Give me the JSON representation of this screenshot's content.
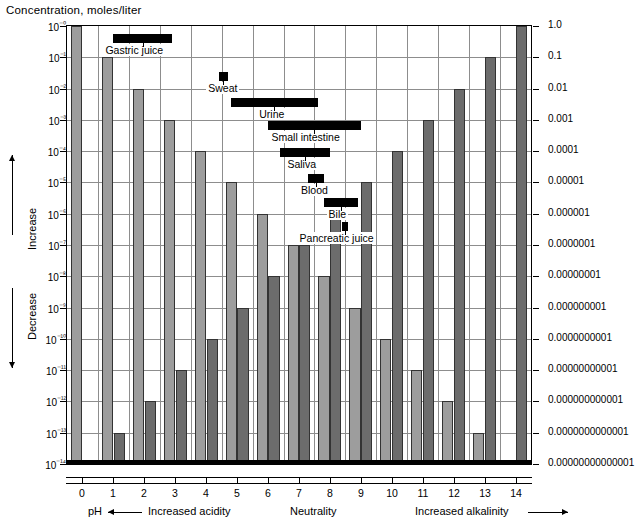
{
  "title": "Concentration, moles/liter",
  "legend": [
    {
      "name": "h-plus",
      "symbol": "=[H⁺]",
      "color": "#9d9d9d"
    },
    {
      "name": "oh-minus",
      "symbol": "=[OH⁻]",
      "color": "#6c6c6c"
    }
  ],
  "axes": {
    "left_ticks": [
      "10⁻⁰",
      "10⁻¹",
      "10⁻²",
      "10⁻³",
      "10⁻⁴",
      "10⁻⁵",
      "10⁻⁶",
      "10⁻⁷",
      "10⁻⁸",
      "10⁻⁹",
      "10⁻¹⁰",
      "10⁻¹¹",
      "10⁻¹²",
      "10⁻¹³",
      "10⁻¹⁴"
    ],
    "right_ticks": [
      "1.0",
      "0.1",
      "0.01",
      "0.001",
      "0.0001",
      "0.00001",
      "0.000001",
      "0.0000001",
      "0.00000001",
      "0.000000001",
      "0.0000000001",
      "0.00000000001",
      "0.000000000001",
      "0.0000000000001",
      "0.00000000000001"
    ],
    "x_ticks": [
      "0",
      "1",
      "2",
      "3",
      "4",
      "5",
      "6",
      "7",
      "8",
      "9",
      "10",
      "11",
      "12",
      "13",
      "14"
    ],
    "x_caption_ph": "pH",
    "x_caption_acidity": "Increased acidity",
    "x_caption_neutrality": "Neutrality",
    "x_caption_alkalinity": "Increased alkalinity",
    "y_caption_increase": "Increase",
    "y_caption_decrease": "Decrease"
  },
  "chart_data": {
    "type": "bar",
    "title": "Concentration, moles/liter",
    "xlabel": "pH",
    "ylabel": "Concentration, moles/liter",
    "ylim": [
      1e-14,
      1
    ],
    "yscale": "log",
    "grid": true,
    "legend_position": "top-right",
    "categories": [
      "0",
      "1",
      "2",
      "3",
      "4",
      "5",
      "6",
      "7",
      "8",
      "9",
      "10",
      "11",
      "12",
      "13",
      "14"
    ],
    "series": [
      {
        "name": "[H+]",
        "color": "#9d9d9d",
        "exponents": [
          0,
          -1,
          -2,
          -3,
          -4,
          -5,
          -6,
          -7,
          -8,
          -9,
          -10,
          -11,
          -12,
          -13,
          -14
        ],
        "values": [
          1,
          0.1,
          0.01,
          0.001,
          0.0001,
          1e-05,
          1e-06,
          1e-07,
          1e-08,
          1e-09,
          1e-10,
          1e-11,
          1e-12,
          1e-13,
          1e-14
        ]
      },
      {
        "name": "[OH-]",
        "color": "#6c6c6c",
        "exponents": [
          -14,
          -13,
          -12,
          -11,
          -10,
          -9,
          -8,
          -7,
          -6,
          -5,
          -4,
          -3,
          -2,
          -1,
          0
        ],
        "values": [
          1e-14,
          1e-13,
          1e-12,
          1e-11,
          1e-10,
          1e-09,
          1e-08,
          1e-07,
          1e-06,
          1e-05,
          0.0001,
          0.001,
          0.01,
          0.1,
          1
        ]
      }
    ],
    "annotations": [
      {
        "label": "Gastric juice",
        "ph_min": 1.0,
        "ph_max": 2.9,
        "row": 0
      },
      {
        "label": "Sweat",
        "ph_min": 4.4,
        "ph_max": 4.7,
        "row": 1
      },
      {
        "label": "Urine",
        "ph_min": 4.8,
        "ph_max": 7.6,
        "row": 2
      },
      {
        "label": "Small intestine",
        "ph_min": 6.0,
        "ph_max": 9.0,
        "row": 3
      },
      {
        "label": "Saliva",
        "ph_min": 6.4,
        "ph_max": 8.0,
        "row": 4
      },
      {
        "label": "Blood",
        "ph_min": 7.3,
        "ph_max": 7.8,
        "row": 5
      },
      {
        "label": "Bile",
        "ph_min": 7.8,
        "ph_max": 8.9,
        "row": 6
      },
      {
        "label": "Pancreatic juice",
        "ph_min": 8.4,
        "ph_max": 8.6,
        "row": 7
      }
    ]
  }
}
